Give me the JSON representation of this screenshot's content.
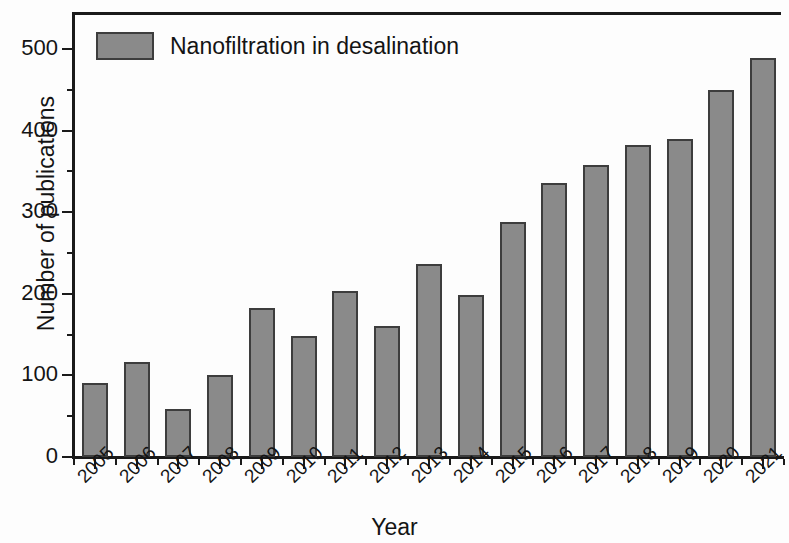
{
  "chart_data": {
    "type": "bar",
    "title": "",
    "xlabel": "Year",
    "ylabel": "Number of publications",
    "categories": [
      "2005",
      "2006",
      "2007",
      "2008",
      "2009",
      "2010",
      "2011",
      "2012",
      "2013",
      "2014",
      "2015",
      "2016",
      "2017",
      "2018",
      "2019",
      "2020",
      "2021"
    ],
    "values": [
      91,
      116,
      59,
      101,
      182,
      148,
      204,
      161,
      237,
      198,
      288,
      336,
      358,
      382,
      390,
      450,
      489
    ],
    "series": [
      {
        "name": "Nanofiltration in desalination",
        "values": [
          91,
          116,
          59,
          101,
          182,
          148,
          204,
          161,
          237,
          198,
          288,
          336,
          358,
          382,
          390,
          450,
          489
        ]
      }
    ],
    "ylim": [
      0,
      520
    ],
    "ytick_labels": [
      "0",
      "100",
      "200",
      "300",
      "400",
      "500"
    ],
    "ytick_values": [
      0,
      100,
      200,
      300,
      400,
      500
    ],
    "yminor_values": [
      50,
      150,
      250,
      350,
      450
    ],
    "grid": false,
    "legend": {
      "position": "top-left",
      "entries": [
        "Nanofiltration in desalination"
      ]
    },
    "bar_color": "#8a8a8a",
    "bar_edge_color": "#3d3d3d",
    "axis_color": "#1a1a1a",
    "background_color": "#ffffff",
    "xtick_rotation": -45
  }
}
